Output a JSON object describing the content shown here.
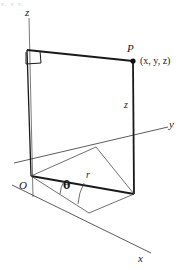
{
  "figure": {
    "title_fragment": "v, v  v,",
    "colors": {
      "stroke": "#1a1a1a",
      "thin_stroke": "#555555",
      "background": "#ffffff",
      "label": "#1a1a1a"
    },
    "labels": {
      "z_axis": "z",
      "y_axis": "y",
      "x_axis": "x",
      "point": "P",
      "coordinates": "(x, y, z)",
      "origin": "O",
      "height_segment": "z",
      "radius_segment": "r",
      "angle": "θ"
    },
    "geometry": {
      "origin": {
        "x": 31,
        "y": 176
      },
      "point_p": {
        "x": 133,
        "y": 61
      },
      "point_p_base": {
        "x": 134,
        "y": 194
      },
      "z_axis_top": {
        "x": 29,
        "y": 18
      },
      "z_axis_bottom": {
        "x": 33,
        "y": 197
      },
      "top_left_corner": {
        "x": 27,
        "y": 50
      },
      "y_axis_end": {
        "x": 168,
        "y": 127
      },
      "x_axis_end": {
        "x": 151,
        "y": 253
      },
      "y_axis_back": {
        "x": 14,
        "y": 163
      },
      "x_axis_back": {
        "x": 12,
        "y": 185
      }
    }
  }
}
